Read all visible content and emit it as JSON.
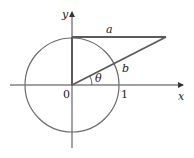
{
  "diagram": {
    "type": "unit-circle-triangle",
    "colors": {
      "axis": "#444444",
      "circle": "#6b6b6b",
      "triangle": "#5a5a5a",
      "text": "#222222"
    },
    "labels": {
      "x_axis": "x",
      "y_axis": "y",
      "origin": "0",
      "one": "1",
      "side_a": "a",
      "side_b": "b",
      "angle": "θ"
    }
  }
}
